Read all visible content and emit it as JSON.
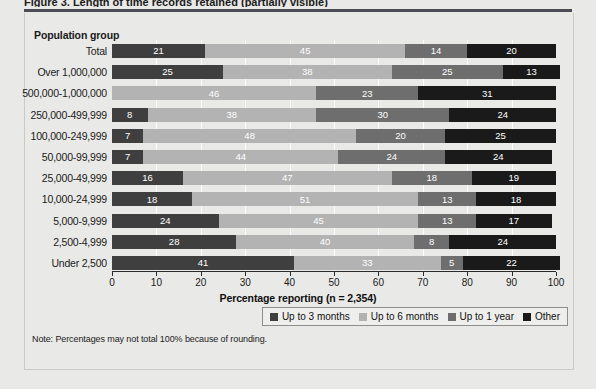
{
  "figure": {
    "title_clipped": "Figure 3. Length of time records retained (partially visible)",
    "panel_heading": "Population group",
    "note": "Note: Percentages may not total 100% because of rounding."
  },
  "chart_data": {
    "type": "bar",
    "orientation": "horizontal",
    "stacked": true,
    "title": "",
    "xlabel": "Percentage reporting (n = 2,354)",
    "ylabel": "Population group",
    "xlim": [
      0,
      100
    ],
    "xticks": [
      0,
      10,
      20,
      30,
      40,
      50,
      60,
      70,
      80,
      90,
      100
    ],
    "grid": true,
    "legend_position": "bottom-right",
    "categories": [
      "Total",
      "Over 1,000,000",
      "500,000-1,000,000",
      "250,000-499,999",
      "100,000-249,999",
      "50,000-99,999",
      "25,000-49,999",
      "10,000-24,999",
      "5,000-9,999",
      "2,500-4,999",
      "Under 2,500"
    ],
    "series": [
      {
        "name": "Up to 3 months",
        "color": "#3f3f3f",
        "values": [
          21,
          25,
          0,
          8,
          7,
          7,
          16,
          18,
          24,
          28,
          41
        ]
      },
      {
        "name": "Up to 6 months",
        "color": "#b3b3b3",
        "values": [
          45,
          38,
          46,
          38,
          48,
          44,
          47,
          51,
          45,
          40,
          33
        ]
      },
      {
        "name": "Up to 1 year",
        "color": "#6e6e6e",
        "values": [
          14,
          25,
          23,
          30,
          20,
          24,
          18,
          13,
          13,
          8,
          5
        ]
      },
      {
        "name": "Other",
        "color": "#1a1a1a",
        "values": [
          20,
          13,
          31,
          24,
          25,
          24,
          19,
          18,
          17,
          24,
          22
        ]
      }
    ]
  }
}
